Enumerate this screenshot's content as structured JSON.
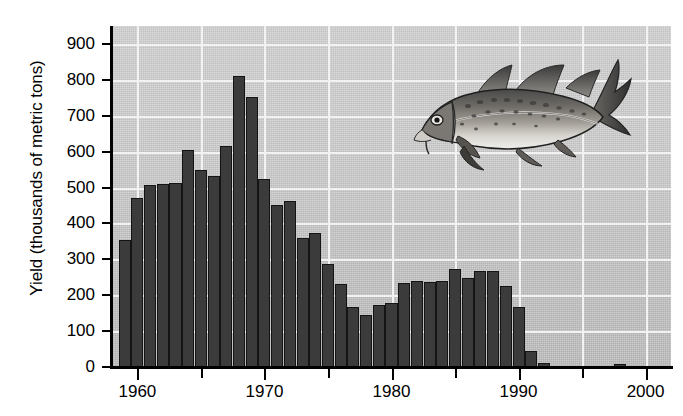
{
  "chart_data": {
    "type": "bar",
    "title": "",
    "xlabel": "",
    "ylabel": "Yield (thousands of metric tons)",
    "ylim": [
      0,
      950
    ],
    "xlim": [
      1958,
      2002
    ],
    "grid": true,
    "legend": null,
    "y_ticks": [
      0,
      100,
      200,
      300,
      400,
      500,
      600,
      700,
      800,
      900
    ],
    "y_tick_labels": [
      "0",
      "100",
      "200",
      "300",
      "400",
      "500",
      "600",
      "700",
      "800",
      "900"
    ],
    "x_major_ticks": [
      1960,
      1970,
      1980,
      1990,
      2000
    ],
    "x_major_tick_labels": [
      "1960",
      "1970",
      "1980",
      "1990",
      "2000"
    ],
    "x_minor_ticks": [
      1965,
      1975,
      1985,
      1995
    ],
    "bar_color": "#3b3b3b",
    "plot_background": "#c9c9c9",
    "gridline_color": "#f2f2f2",
    "annotation_image": "atlantic-cod-illustration",
    "categories": [
      1959,
      1960,
      1961,
      1962,
      1963,
      1964,
      1965,
      1966,
      1967,
      1968,
      1969,
      1970,
      1971,
      1972,
      1973,
      1974,
      1975,
      1976,
      1977,
      1978,
      1979,
      1980,
      1981,
      1982,
      1983,
      1984,
      1985,
      1986,
      1987,
      1988,
      1989,
      1990,
      1991,
      1992,
      1993,
      1994,
      1995,
      1996,
      1997,
      1998,
      1999,
      2000
    ],
    "values": [
      355,
      470,
      508,
      510,
      512,
      605,
      548,
      533,
      615,
      812,
      752,
      523,
      450,
      462,
      360,
      372,
      288,
      230,
      168,
      144,
      172,
      178,
      235,
      240,
      237,
      240,
      272,
      248,
      268,
      267,
      225,
      168,
      45,
      12,
      0,
      0,
      0,
      0,
      0,
      9,
      0,
      0
    ]
  },
  "axis": {
    "y_title": "Yield (thousands of metric tons)"
  }
}
